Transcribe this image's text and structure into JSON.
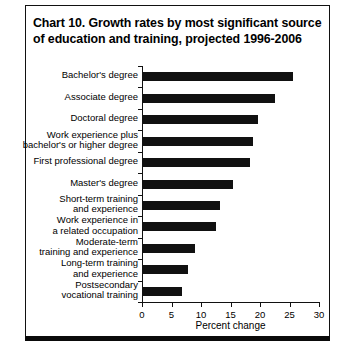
{
  "title": "Chart 10. Growth rates by most significant source of education and training, projected 1996-2006",
  "axis": {
    "x_title": "Percent change",
    "x_ticks": [
      "0",
      "5",
      "10",
      "15",
      "20",
      "25",
      "30"
    ]
  },
  "chart_data": {
    "type": "bar",
    "orientation": "horizontal",
    "title": "Chart 10. Growth rates by most significant source of education and training, projected 1996-2006",
    "xlabel": "Percent change",
    "ylabel": "",
    "xlim": [
      0,
      30
    ],
    "xticks": [
      0,
      5,
      10,
      15,
      20,
      25,
      30
    ],
    "grid": false,
    "legend": "none",
    "bar_color": "#111111",
    "categories": [
      "Bachelor's degree",
      "Associate degree",
      "Doctoral degree",
      "Work experience plus bachelor's or higher degree",
      "First professional degree",
      "Master's degree",
      "Short-term training and experience",
      "Work experience in a related occupation",
      "Moderate-term training and experience",
      "Long-term training and experience",
      "Postsecondary vocational training"
    ],
    "category_lines": [
      "Bachelor's degree",
      "Associate degree",
      "Doctoral degree",
      "Work experience plus\nbachelor's or higher degree",
      "First professional degree",
      "Master's degree",
      "Short-term training\nand experience",
      "Work experience in\na related occupation",
      "Moderate-term\ntraining and experience",
      "Long-term training\nand experience",
      "Postsecondary\nvocational training"
    ],
    "values": [
      25.5,
      22.4,
      19.5,
      18.6,
      18.2,
      15.3,
      13.0,
      12.3,
      8.8,
      7.6,
      6.6
    ]
  }
}
